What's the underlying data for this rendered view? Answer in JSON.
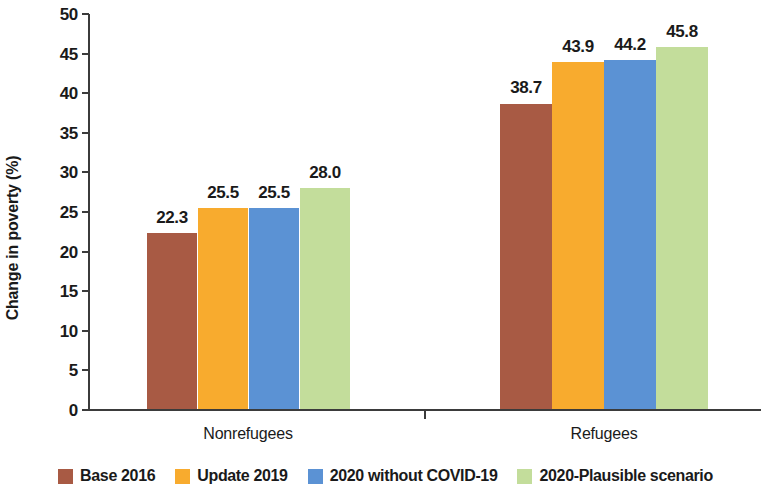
{
  "chart_data": {
    "type": "bar",
    "title": "",
    "xlabel": "",
    "ylabel": "Change in poverty (%)",
    "ylim": [
      0,
      50
    ],
    "ytick_step": 5,
    "ytick_labels": [
      "50",
      "45",
      "40",
      "35",
      "30",
      "25",
      "20",
      "15",
      "10",
      "5",
      "0"
    ],
    "grid": false,
    "legend_position": "bottom",
    "categories": [
      "Nonrefugees",
      "Refugees"
    ],
    "series": [
      {
        "name": "Base 2016",
        "color": "#a85a44",
        "values": [
          22.3,
          38.7
        ],
        "labels": [
          "22.3",
          "38.7"
        ]
      },
      {
        "name": "Update 2019",
        "color": "#f8ab2e",
        "values": [
          25.5,
          43.9
        ],
        "labels": [
          "25.5",
          "43.9"
        ]
      },
      {
        "name": "2020 without COVID-19",
        "color": "#5b92d4",
        "values": [
          25.5,
          44.2
        ],
        "labels": [
          "25.5",
          "44.2"
        ]
      },
      {
        "name": "2020-Plausible scenario",
        "color": "#c3dd9b",
        "values": [
          28.0,
          45.8
        ],
        "labels": [
          "28.0",
          "45.8"
        ]
      }
    ]
  },
  "axis": {
    "y_title": "Change in poverty (%)"
  },
  "legend": {
    "items": [
      {
        "label": "Base 2016",
        "color": "#a85a44"
      },
      {
        "label": "Update 2019",
        "color": "#f8ab2e"
      },
      {
        "label": "2020 without COVID-19",
        "color": "#5b92d4"
      },
      {
        "label": "2020-Plausible scenario",
        "color": "#c3dd9b"
      }
    ]
  }
}
